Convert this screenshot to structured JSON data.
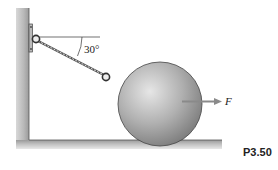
{
  "diagram": {
    "angle_label": "30°",
    "force_label": "F",
    "problem_label": "P3.50",
    "colors": {
      "wall": "#c8c8c8",
      "ball": "#a8a8a8",
      "arrow": "#8a8a8a",
      "line": "#333333"
    }
  }
}
